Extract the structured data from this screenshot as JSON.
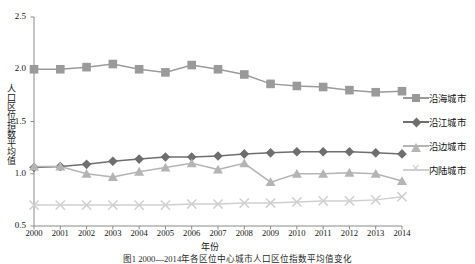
{
  "figure": {
    "top_clipped_text": "",
    "caption": "图1 2000—2014年各区位中心城市人口区位指数平均值变化"
  },
  "chart_data": {
    "type": "line",
    "title": "",
    "xlabel": "年份",
    "ylabel": "人口区位指数平均值",
    "categories": [
      "2000",
      "2001",
      "2002",
      "2003",
      "2004",
      "2005",
      "2006",
      "2007",
      "2008",
      "2009",
      "2010",
      "2011",
      "2012",
      "2013",
      "2014"
    ],
    "xlim": [
      2000,
      2014
    ],
    "ylim": [
      0.5,
      2.5
    ],
    "yticks": [
      0.5,
      1.0,
      1.5,
      2.0,
      2.5
    ],
    "grid": false,
    "legend_position": "right",
    "series": [
      {
        "name": "沿海城市",
        "marker": "square",
        "color": "#9a9a9a",
        "values": [
          2.0,
          2.0,
          2.02,
          2.05,
          2.0,
          1.97,
          2.04,
          2.0,
          1.95,
          1.86,
          1.84,
          1.83,
          1.8,
          1.78,
          1.79
        ]
      },
      {
        "name": "沿江城市",
        "marker": "diamond",
        "color": "#6e6e6e",
        "values": [
          1.06,
          1.07,
          1.09,
          1.12,
          1.14,
          1.16,
          1.16,
          1.17,
          1.19,
          1.2,
          1.21,
          1.21,
          1.21,
          1.2,
          1.19
        ]
      },
      {
        "name": "沿边城市",
        "marker": "triangle",
        "color": "#b4b4b4",
        "values": [
          1.07,
          1.07,
          1.0,
          0.97,
          1.02,
          1.06,
          1.1,
          1.04,
          1.1,
          0.92,
          1.0,
          1.0,
          1.01,
          1.0,
          0.93
        ]
      },
      {
        "name": "内陆城市",
        "marker": "x",
        "color": "#cfcfcf",
        "values": [
          0.7,
          0.7,
          0.7,
          0.7,
          0.7,
          0.7,
          0.71,
          0.71,
          0.72,
          0.72,
          0.73,
          0.74,
          0.74,
          0.75,
          0.78
        ]
      }
    ]
  }
}
